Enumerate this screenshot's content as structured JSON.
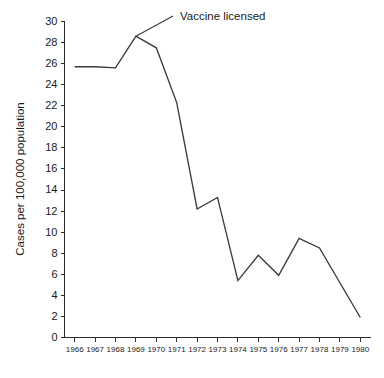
{
  "chart_data": {
    "type": "line",
    "title": "",
    "xlabel": "",
    "ylabel": "Cases per 100,000 population",
    "x": [
      1966,
      1967,
      1968,
      1969,
      1970,
      1971,
      1972,
      1973,
      1974,
      1975,
      1976,
      1977,
      1978,
      1979,
      1980
    ],
    "categories": [
      "1966",
      "1967",
      "1968",
      "1969",
      "1970",
      "1971",
      "1972",
      "1973",
      "1974",
      "1975",
      "1976",
      "1977",
      "1978",
      "1979",
      "1980"
    ],
    "values": [
      25.7,
      25.7,
      25.6,
      28.6,
      27.5,
      22.3,
      12.2,
      13.3,
      5.4,
      7.8,
      5.9,
      9.4,
      8.5,
      5.2,
      1.9
    ],
    "series": [
      {
        "name": "Cases per 100,000 population",
        "values": [
          25.7,
          25.7,
          25.6,
          28.6,
          27.5,
          22.3,
          12.2,
          13.3,
          5.4,
          7.8,
          5.9,
          9.4,
          8.5,
          5.2,
          1.9
        ]
      }
    ],
    "ylim": [
      0,
      30
    ],
    "ytick_values": [
      0,
      2,
      4,
      6,
      8,
      10,
      12,
      14,
      16,
      18,
      20,
      22,
      24,
      26,
      28,
      30
    ],
    "ytick_labels": [
      "0",
      "2",
      "4",
      "6",
      "8",
      "10",
      "12",
      "14",
      "16",
      "18",
      "20",
      "22",
      "24",
      "26",
      "28",
      "30"
    ],
    "xlim": [
      1966,
      1980
    ],
    "grid": false,
    "legend": "none",
    "line_color": "#3a3a3a",
    "axis_color": "#2b2b2b",
    "background_color": "#ffffff",
    "annotations": [
      {
        "label": "Vaccine licensed",
        "points_to_x": 1969,
        "points_to_y": 28.6,
        "leader": true
      }
    ]
  }
}
